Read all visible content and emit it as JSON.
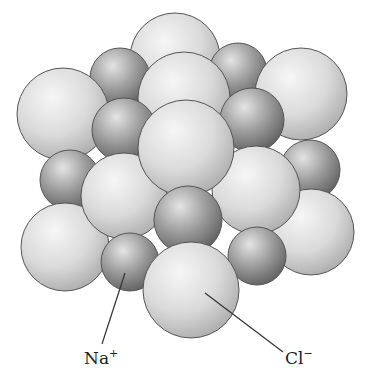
{
  "diagram": {
    "labels": {
      "na": {
        "base": "Na",
        "sup": "+"
      },
      "cl": {
        "base": "Cl",
        "sup": "−"
      }
    },
    "colors": {
      "large_light": "#e6e6e6",
      "large_mid": "#bcbcbc",
      "small_light": "#d0d0d0",
      "small_dark": "#6c6c6c",
      "outline": "#555555",
      "leader": "#333333"
    }
  }
}
